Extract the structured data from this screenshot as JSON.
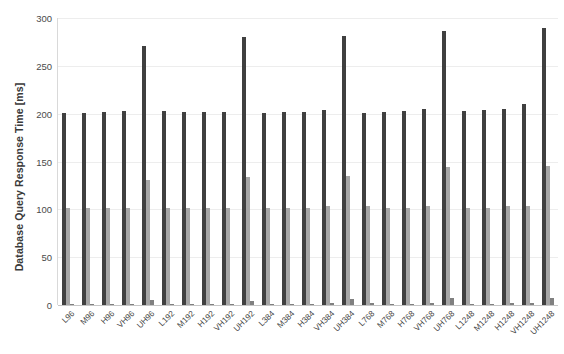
{
  "chart_data": {
    "type": "bar",
    "title": "",
    "xlabel": "",
    "ylabel": "Database Query Response Time [ms]",
    "ylim": [
      0,
      300
    ],
    "yticks": [
      0,
      50,
      100,
      150,
      200,
      250,
      300
    ],
    "ytick_labels": [
      "0",
      "50",
      "100",
      "150",
      "200",
      "250",
      "300"
    ],
    "grid": true,
    "legend": "none",
    "categories": [
      "L96",
      "M96",
      "H96",
      "VH96",
      "UH96",
      "L192",
      "M192",
      "H192",
      "VH192",
      "UH192",
      "L384",
      "M384",
      "H384",
      "VH384",
      "UH384",
      "L768",
      "M768",
      "H768",
      "VH768",
      "UH768",
      "L1248",
      "M1248",
      "H1248",
      "VH1248",
      "UH1248"
    ],
    "series": [
      {
        "name": "Series 1",
        "color": "#404040",
        "values": [
          201,
          201,
          202,
          203,
          271,
          203,
          202,
          202,
          202,
          280,
          201,
          202,
          202,
          204,
          281,
          201,
          202,
          203,
          205,
          286,
          203,
          204,
          205,
          210,
          290
        ]
      },
      {
        "name": "Series 2",
        "color": "#a6a6a6",
        "values": [
          101,
          101,
          101,
          101,
          131,
          101,
          101,
          101,
          101,
          134,
          101,
          101,
          101,
          103,
          135,
          104,
          101,
          101,
          104,
          144,
          101,
          101,
          103,
          104,
          145
        ]
      },
      {
        "name": "Series 3",
        "color": "#808080",
        "values": [
          1,
          1,
          1,
          1,
          5,
          1,
          1,
          1,
          1,
          4,
          1,
          1,
          1,
          2,
          6,
          2,
          1,
          1,
          2,
          7,
          1,
          1,
          2,
          2,
          7
        ]
      }
    ]
  }
}
